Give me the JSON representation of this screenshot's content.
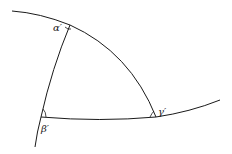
{
  "diagram": {
    "vertices": [
      {
        "id": "alpha",
        "label": "α′"
      },
      {
        "id": "beta",
        "label": "β′"
      },
      {
        "id": "gamma",
        "label": "γ′"
      }
    ],
    "colors": {
      "stroke": "#1a1a1a",
      "label": "#222222",
      "background": "#ffffff"
    }
  }
}
